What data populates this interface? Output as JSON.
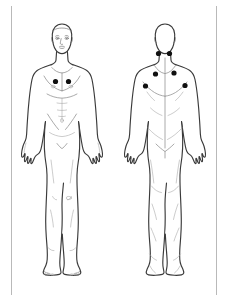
{
  "document": {
    "title": "Body Pain Diagram",
    "background_color": "#ffffff",
    "frame_color": "#b9b9b9",
    "outline_color": "#3a3a3a",
    "detail_color": "#8d8d8d",
    "marker_color": "#101010"
  },
  "views": [
    {
      "id": "anterior",
      "label": "Front view",
      "figure_name": "human-figure-front",
      "markers": [
        {
          "id": "front-chest-right",
          "label": "Upper chest right",
          "x": 55.5,
          "y": 81.5,
          "r": 2.6
        },
        {
          "id": "front-chest-left",
          "label": "Upper chest left",
          "x": 68.5,
          "y": 81.5,
          "r": 2.6
        }
      ]
    },
    {
      "id": "posterior",
      "label": "Back view",
      "figure_name": "human-figure-back",
      "markers": [
        {
          "id": "back-neck-right",
          "label": "Base of neck right",
          "x": 158.5,
          "y": 53.5,
          "r": 2.6
        },
        {
          "id": "back-neck-left",
          "label": "Base of neck left",
          "x": 169.5,
          "y": 53.5,
          "r": 2.6
        },
        {
          "id": "back-upper-right",
          "label": "Upper back right",
          "x": 155.5,
          "y": 74.0,
          "r": 2.6
        },
        {
          "id": "back-upper-left",
          "label": "Upper back left",
          "x": 174.0,
          "y": 73.0,
          "r": 2.6
        },
        {
          "id": "back-scapula-right",
          "label": "Scapular area right",
          "x": 145.5,
          "y": 86.0,
          "r": 2.6
        },
        {
          "id": "back-scapula-left",
          "label": "Scapular area left",
          "x": 185.0,
          "y": 85.5,
          "r": 2.6
        }
      ]
    }
  ],
  "marker_summary": {
    "total": 8,
    "front_count": 2,
    "back_count": 6
  }
}
